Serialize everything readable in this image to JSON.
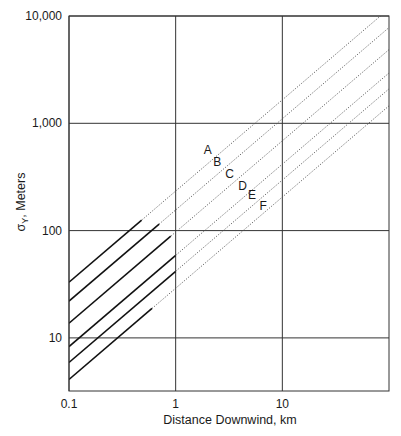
{
  "chart_data": {
    "type": "line",
    "title": "",
    "xlabel": "Distance Downwind, km",
    "ylabel": "σY, Meters",
    "ylabel_main": "σ",
    "ylabel_sub": "Y",
    "ylabel_rest": ", Meters",
    "xscale": "log",
    "yscale": "log",
    "xlim": [
      0.1,
      100
    ],
    "ylim": [
      3.2,
      10000
    ],
    "grid": true,
    "legend": "none (curves labeled inline)",
    "x_ticks": [
      {
        "value": 0.1,
        "label": "0.1"
      },
      {
        "value": 1,
        "label": "1"
      },
      {
        "value": 10,
        "label": "10"
      }
    ],
    "y_ticks": [
      {
        "value": 10,
        "label": "10"
      },
      {
        "value": 100,
        "label": "100"
      },
      {
        "value": 1000,
        "label": "1,000"
      },
      {
        "value": 10000,
        "label": "10,000"
      }
    ],
    "exponent": 0.85,
    "series": [
      {
        "name": "A",
        "sigma_at_0_1km": 33,
        "solid_until_km": 0.48,
        "label_pos": [
          2.0,
          520
        ]
      },
      {
        "name": "B",
        "sigma_at_0_1km": 22,
        "solid_until_km": 0.7,
        "label_pos": [
          2.45,
          400
        ]
      },
      {
        "name": "C",
        "sigma_at_0_1km": 13.7,
        "solid_until_km": 0.9,
        "label_pos": [
          3.2,
          310
        ]
      },
      {
        "name": "D",
        "sigma_at_0_1km": 8.3,
        "solid_until_km": 1.0,
        "label_pos": [
          4.25,
          240
        ]
      },
      {
        "name": "E",
        "sigma_at_0_1km": 5.9,
        "solid_until_km": 1.0,
        "label_pos": [
          5.2,
          195
        ]
      },
      {
        "name": "F",
        "sigma_at_0_1km": 4.1,
        "solid_until_km": 0.6,
        "label_pos": [
          6.6,
          155
        ]
      }
    ]
  },
  "colors": {
    "axis": "#333333",
    "grid": "#333333",
    "solid_line": "#111111",
    "dotted_line": "#555555",
    "text": "#1a1a1a"
  }
}
